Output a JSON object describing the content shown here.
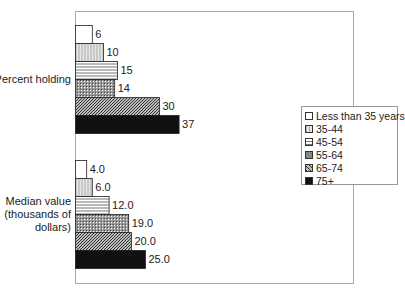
{
  "chart_data": {
    "type": "bar",
    "orientation": "horizontal",
    "title": "",
    "xlabel": "",
    "ylabel": "",
    "grid": false,
    "legend_position": "right",
    "categories": [
      "Percent holding",
      "Median value (thousands of dollars)"
    ],
    "category_lines": [
      [
        "Percent holding"
      ],
      [
        "Median value",
        "(thousands of",
        "dollars)"
      ]
    ],
    "series": [
      {
        "name": "Less than 35 years",
        "values": [
          6,
          4.0
        ],
        "labels": [
          "6",
          "4.0"
        ],
        "pattern": "white"
      },
      {
        "name": "35-44",
        "values": [
          10,
          6.0
        ],
        "labels": [
          "10",
          "6.0"
        ],
        "pattern": "vertical"
      },
      {
        "name": "45-54",
        "values": [
          15,
          12.0
        ],
        "labels": [
          "15",
          "12.0"
        ],
        "pattern": "horizontal"
      },
      {
        "name": "55-64",
        "values": [
          14,
          19.0
        ],
        "labels": [
          "14",
          "19.0"
        ],
        "pattern": "crosshatch"
      },
      {
        "name": "65-74",
        "values": [
          30,
          20.0
        ],
        "labels": [
          "30",
          "20.0"
        ],
        "pattern": "diagonal"
      },
      {
        "name": "75+",
        "values": [
          37,
          25.0
        ],
        "labels": [
          "37",
          "25.0"
        ],
        "pattern": "black"
      }
    ]
  }
}
